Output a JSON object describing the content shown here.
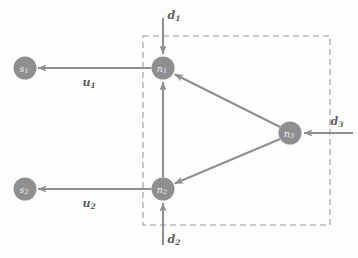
{
  "figure": {
    "background_color": "#fefefe",
    "node_fill": "#8f8f8f",
    "node_text_color": "#f2f2f2",
    "edge_color": "#8f8f8f",
    "dashed_box_color": "#9a9a9a",
    "label_color": "#5d5d5d"
  },
  "nodes": [
    {
      "id": "s1",
      "base": "s",
      "sub": "1",
      "cx": 25,
      "cy": 68,
      "r": 11.5,
      "inside_box": false
    },
    {
      "id": "s2",
      "base": "s",
      "sub": "2",
      "cx": 25,
      "cy": 189,
      "r": 11.5,
      "inside_box": false
    },
    {
      "id": "n1",
      "base": "n",
      "sub": "1",
      "cx": 163,
      "cy": 68,
      "r": 11.5,
      "inside_box": true
    },
    {
      "id": "n2",
      "base": "n",
      "sub": "2",
      "cx": 163,
      "cy": 189,
      "r": 11.5,
      "inside_box": true
    },
    {
      "id": "n3",
      "base": "n",
      "sub": "3",
      "cx": 290,
      "cy": 133,
      "r": 11.5,
      "inside_box": true
    }
  ],
  "dashed_box": {
    "x": 143,
    "y": 36,
    "width": 187,
    "height": 189
  },
  "edges": [
    {
      "id": "n1-to-s1",
      "from": "n1",
      "to": "s1",
      "label_base": "u",
      "label_sub": "1",
      "label_x": 89,
      "label_y": 82
    },
    {
      "id": "n2-to-s2",
      "from": "n2",
      "to": "s2",
      "label_base": "u",
      "label_sub": "2",
      "label_x": 89,
      "label_y": 203
    },
    {
      "id": "n2-to-n1",
      "from": "n2",
      "to": "n1",
      "label_base": "",
      "label_sub": "",
      "label_x": 0,
      "label_y": 0
    },
    {
      "id": "n3-to-n1",
      "from": "n3",
      "to": "n1",
      "label_base": "",
      "label_sub": "",
      "label_x": 0,
      "label_y": 0
    },
    {
      "id": "n3-to-n2",
      "from": "n3",
      "to": "n2",
      "label_base": "",
      "label_sub": "",
      "label_x": 0,
      "label_y": 0
    }
  ],
  "inputs": [
    {
      "id": "d1",
      "base": "d",
      "sub": "1",
      "target": "n1",
      "direction": "down",
      "label_x": 174,
      "label_y": 15,
      "line": {
        "x1": 163,
        "y1": 18,
        "x2": 163,
        "y2": 54
      }
    },
    {
      "id": "d2",
      "base": "d",
      "sub": "2",
      "target": "n2",
      "direction": "up",
      "label_x": 174,
      "label_y": 239,
      "line": {
        "x1": 163,
        "y1": 245,
        "x2": 163,
        "y2": 203
      }
    },
    {
      "id": "d3",
      "base": "d",
      "sub": "3",
      "target": "n3",
      "direction": "left",
      "label_x": 337,
      "label_y": 121,
      "line": {
        "x1": 353,
        "y1": 133,
        "x2": 304,
        "y2": 133
      }
    }
  ]
}
